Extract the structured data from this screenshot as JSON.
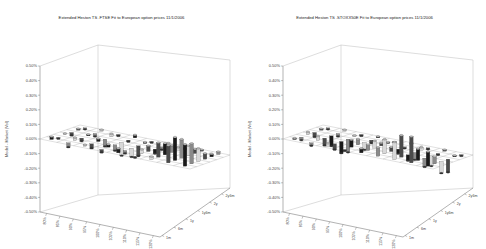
{
  "chart_data": [
    {
      "type": "bar3d",
      "title": "Extended Heston TS .FTSE Fit to European option prices 11/1/2006",
      "ylabel": "Model - Market (Vol)",
      "yticks": [
        "0.50%",
        "0.40%",
        "0.30%",
        "0.20%",
        "0.10%",
        "0.00%",
        "-0.10%",
        "-0.20%",
        "-0.30%",
        "-0.40%",
        "-0.50%"
      ],
      "ylim": [
        -0.5,
        0.5
      ],
      "xlabel": "Moneyness",
      "xticks": [
        "80%",
        "85%",
        "90%",
        "95%",
        "100%",
        "105%",
        "110%",
        "115%",
        "120%"
      ],
      "zlabel": "Maturity",
      "zticks": [
        "1m",
        "6m",
        "1y",
        "1y6m",
        "2y",
        "2y6m"
      ],
      "grid": true,
      "values": [
        [
          0.02,
          -0.03,
          0.01,
          -0.02,
          0.03,
          -0.01,
          0.02,
          0.12,
          0.15
        ],
        [
          -0.01,
          0.02,
          -0.03,
          0.02,
          -0.02,
          0.03,
          0.1,
          0.16,
          0.14
        ],
        [
          0.01,
          -0.02,
          0.02,
          -0.04,
          -0.06,
          0.04,
          0.08,
          0.13,
          0.09
        ],
        [
          -0.02,
          0.01,
          -0.05,
          -0.09,
          -0.07,
          -0.03,
          0.05,
          0.07,
          0.04
        ],
        [
          0.01,
          -0.02,
          0.02,
          -0.01,
          0.01,
          -0.02,
          0.02,
          0.03,
          0.02
        ],
        [
          -0.01,
          0.01,
          -0.01,
          0.02,
          -0.01,
          0.01,
          -0.01,
          0.01,
          0.02
        ]
      ]
    },
    {
      "type": "bar3d",
      "title": "Extended Heston TS .STOXX50E Fit to European option prices 11/1/2006",
      "ylabel": "Model - Market (Vol)",
      "yticks": [
        "0.50%",
        "0.40%",
        "0.30%",
        "0.20%",
        "0.10%",
        "0.00%",
        "-0.10%",
        "-0.20%",
        "-0.30%",
        "-0.40%",
        "-0.50%"
      ],
      "ylim": [
        -0.5,
        0.5
      ],
      "xlabel": "Moneyness",
      "xticks": [
        "80%",
        "85%",
        "90%",
        "95%",
        "100%",
        "105%",
        "110%",
        "115%",
        "120%"
      ],
      "zlabel": "Maturity",
      "zticks": [
        "1m",
        "6m",
        "1y",
        "1y6m",
        "2y",
        "2y6m"
      ],
      "grid": true,
      "values": [
        [
          0.01,
          -0.02,
          0.02,
          -0.01,
          0.03,
          0.06,
          0.12,
          0.18,
          0.1
        ],
        [
          -0.02,
          0.03,
          -0.04,
          0.05,
          0.04,
          0.1,
          0.15,
          0.08,
          0.05
        ],
        [
          0.02,
          -0.05,
          -0.08,
          0.04,
          0.05,
          0.03,
          -0.04,
          -0.06,
          -0.08
        ],
        [
          -0.03,
          -0.07,
          -0.09,
          -0.05,
          0.02,
          -0.03,
          -0.05,
          -0.07,
          -0.09
        ],
        [
          0.01,
          -0.02,
          0.01,
          -0.02,
          0.01,
          -0.01,
          0.02,
          -0.01,
          0.01
        ],
        [
          -0.01,
          0.01,
          -0.01,
          0.01,
          -0.01,
          0.01,
          -0.01,
          0.01,
          -0.01
        ]
      ]
    }
  ],
  "charts": [
    {
      "title": "Extended Heston TS .FTSE Fit to European option prices 11/1/2006"
    },
    {
      "title": "Extended Heston TS .STOXX50E Fit to European option prices 11/1/2006"
    }
  ]
}
